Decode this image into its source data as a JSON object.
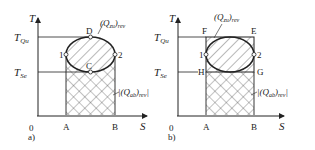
{
  "diagrams": [
    {
      "id": "a",
      "caption": "a)",
      "axis_y": "T",
      "axis_x": "S",
      "origin": "0",
      "t_high_label": "T",
      "t_high_sub": "Qu",
      "t_low_label": "T",
      "t_low_sub": "Se",
      "points": {
        "top": "D",
        "bottom": "C",
        "left": "1",
        "right": "2",
        "x_left": "A",
        "x_right": "B"
      },
      "q_in_label": "(Q",
      "q_in_sub": "zu",
      "q_in_suffix": ")",
      "q_in_rev": "rev",
      "q_out_label": "|(Q",
      "q_out_sub": "ab",
      "q_out_suffix": ")",
      "q_out_rev": "rev",
      "q_out_end": "|"
    },
    {
      "id": "b",
      "caption": "b)",
      "axis_y": "T",
      "axis_x": "S",
      "origin": "0",
      "t_high_label": "T",
      "t_high_sub": "Qu",
      "t_low_label": "T",
      "t_low_sub": "Se",
      "points": {
        "top_left": "F",
        "top_right": "E",
        "bottom_left": "H",
        "bottom_right": "G",
        "left": "1",
        "right": "2",
        "x_left": "A",
        "x_right": "B"
      },
      "q_in_label": "(Q",
      "q_in_sub": "zu",
      "q_in_suffix": ")",
      "q_in_rev": "rev",
      "q_out_label": "|(Q",
      "q_out_sub": "ab",
      "q_out_suffix": ")",
      "q_out_rev": "rev",
      "q_out_end": "|"
    }
  ],
  "colors": {
    "line": "#222222",
    "hatch": "#333333",
    "background": "#ffffff"
  }
}
